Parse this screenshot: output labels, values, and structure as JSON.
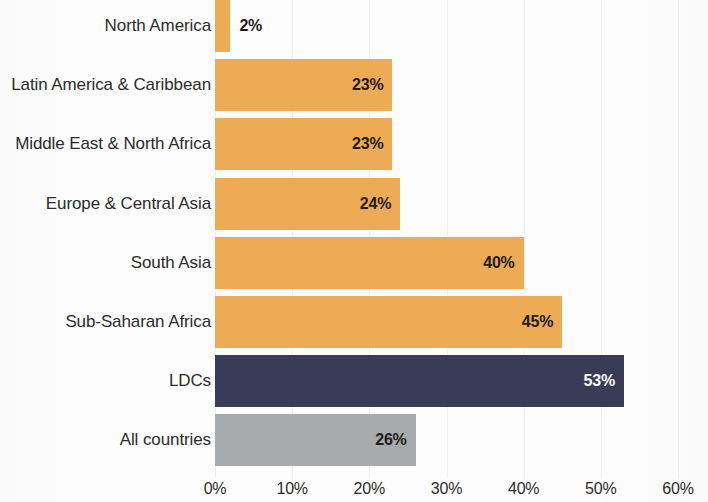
{
  "chart_data": {
    "type": "bar",
    "orientation": "horizontal",
    "title": "",
    "subtitle": "",
    "xlabel": "",
    "ylabel": "",
    "xlim": [
      0,
      60
    ],
    "xticks": [
      "0%",
      "10%",
      "20%",
      "30%",
      "40%",
      "50%",
      "60%"
    ],
    "xtick_values": [
      0,
      10,
      20,
      30,
      40,
      50,
      60
    ],
    "grid": true,
    "legend": "none",
    "categories": [
      "North America",
      "Latin America & Caribbean",
      "Middle East & North Africa",
      "Europe & Central Asia",
      "South Asia",
      "Sub-Saharan Africa",
      "LDCs",
      "All countries"
    ],
    "values": [
      2,
      23,
      23,
      24,
      40,
      45,
      53,
      26
    ],
    "value_labels": [
      "2%",
      "23%",
      "23%",
      "24%",
      "40%",
      "45%",
      "53%",
      "26%"
    ],
    "label_placement": [
      "outside",
      "inside",
      "inside",
      "inside",
      "inside",
      "inside",
      "inside",
      "inside"
    ],
    "bar_colors": [
      "#edab55",
      "#edab55",
      "#edab55",
      "#edab55",
      "#edab55",
      "#edab55",
      "#3a3c57",
      "#a8aaad"
    ],
    "label_colors": [
      "#231d14",
      "#231d14",
      "#231d14",
      "#231d14",
      "#231d14",
      "#231d14",
      "#ffffff",
      "#231d14"
    ],
    "colors": {
      "region_bar": "#edab55",
      "ldc_bar": "#3a3c57",
      "all_countries_bar": "#a8aaad",
      "axis_text": "#2c2c2c",
      "gridline": "#f1f1f1",
      "background": "#fdfdfd"
    }
  }
}
